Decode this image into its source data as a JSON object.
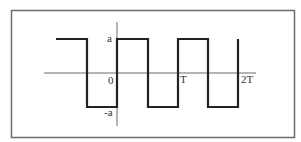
{
  "diagram": {
    "type": "square-wave",
    "labels": {
      "amplitude_pos": "a",
      "amplitude_neg": "-a",
      "origin": "0",
      "period": "T",
      "double_period": "2T"
    },
    "colors": {
      "frame": "#6e6e6e",
      "axis": "#6a6a6a",
      "wave": "#222222",
      "text": "#333333"
    }
  }
}
